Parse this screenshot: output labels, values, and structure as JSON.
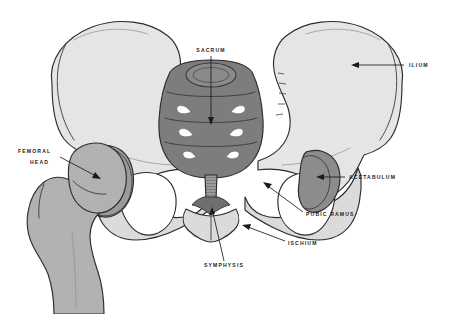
{
  "figure": {
    "view": "Anterior view of the bony pelvis with right femur",
    "background_color": "#ffffff"
  },
  "palette": {
    "background": "#ffffff",
    "ilium_fill": "#e6e6e6",
    "pelvis_body_fill": "#dcdcdc",
    "sacrum_fill": "#7d7d7d",
    "sacrum_shadow": "#6e6e6e",
    "femur_fill": "#b4b4b4",
    "femur_head_fill": "#a8a8a8",
    "acetabulum_fill": "#8c8c8c",
    "foramen_fill": "#ffffff",
    "outline": "#2c2c2c",
    "label_color": "#1b1b1b"
  },
  "labels": [
    {
      "id": "sacrum",
      "text": "SACRUM",
      "text_x": 211,
      "text_y": 52,
      "anchor": "middle",
      "leader": "M211,56 L211,120",
      "arrow_at": [
        211,
        124
      ],
      "arrow_dir": "down"
    },
    {
      "id": "ilium",
      "text": "ILIUM",
      "text_x": 409,
      "text_y": 67,
      "anchor": "start",
      "leader": "M405,65 L357,65",
      "arrow_at": [
        352,
        65
      ],
      "arrow_dir": "left"
    },
    {
      "id": "femoral-head",
      "text": "FEMORAL",
      "text_line2": "HEAD",
      "text_x": 18,
      "text_y": 153,
      "text2_x": 30,
      "text2_y": 164,
      "anchor": "start",
      "leader": "M62,157 L95,175",
      "arrow_at": [
        99,
        177
      ],
      "arrow_dir": "down-right"
    },
    {
      "id": "acetabulum",
      "text": "ACETABULUM",
      "text_x": 349,
      "text_y": 179,
      "anchor": "start",
      "leader": "M345,177 L322,177",
      "arrow_at": [
        317,
        177
      ],
      "arrow_dir": "left"
    },
    {
      "id": "pubic-ramus",
      "text": "PUBIC RAMUS",
      "text_x": 306,
      "text_y": 216,
      "anchor": "start",
      "leader": "M303,212 L268,186",
      "arrow_at": [
        264,
        183
      ],
      "arrow_dir": "up-left"
    },
    {
      "id": "ischium",
      "text": "ISCHIUM",
      "text_x": 288,
      "text_y": 245,
      "anchor": "start",
      "leader": "M285,241 L248,227",
      "arrow_at": [
        243,
        225
      ],
      "arrow_dir": "up-left"
    },
    {
      "id": "symphysis",
      "text": "SYMPHYSIS",
      "text_x": 224,
      "text_y": 267,
      "anchor": "middle",
      "leader": "M224,261 L212,212",
      "arrow_at": [
        211,
        207
      ],
      "arrow_dir": "up"
    }
  ],
  "structures": [
    {
      "id": "left-ilium",
      "name": "Left iliac wing",
      "fill": "#e6e6e6"
    },
    {
      "id": "right-ilium",
      "name": "Right iliac wing",
      "fill": "#e6e6e6"
    },
    {
      "id": "sacrum-body",
      "name": "Sacrum",
      "fill": "#7d7d7d"
    },
    {
      "id": "sacral-foramina",
      "name": "Anterior sacral foramina",
      "count": 6,
      "fill": "#ffffff"
    },
    {
      "id": "coccyx",
      "name": "Coccyx",
      "fill": "#8a8a8a"
    },
    {
      "id": "left-obturator-foramen",
      "name": "Left obturator foramen",
      "fill": "#ffffff"
    },
    {
      "id": "right-obturator-foramen",
      "name": "Right obturator foramen",
      "fill": "#ffffff"
    },
    {
      "id": "right-acetabulum",
      "name": "Right acetabulum",
      "fill": "#8c8c8c"
    },
    {
      "id": "femur",
      "name": "Proximal femur",
      "fill": "#b4b4b4"
    },
    {
      "id": "femoral-head-ball",
      "name": "Femoral head",
      "fill": "#a8a8a8"
    }
  ]
}
